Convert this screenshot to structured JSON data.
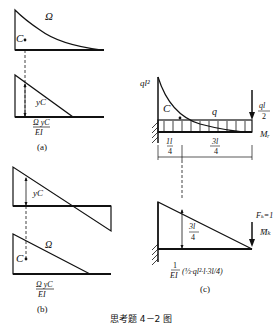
{
  "caption": "思考题 4－2 图",
  "panel_a": {
    "label": "(a)",
    "area_label": "Ω",
    "centroid_label": "C",
    "ordinate_label": "yC",
    "result_num": "Ω yC",
    "result_den": "EI"
  },
  "panel_b": {
    "label": "(b)",
    "area_label": "Ω",
    "centroid_label": "C",
    "ordinate_label": "yC",
    "result_num": "Ω yC",
    "result_den": "EI"
  },
  "panel_c": {
    "label": "(c)",
    "moment_top": "ql²",
    "centroid_label": "C",
    "load_label": "q",
    "force_num": "ql",
    "force_den": "2",
    "fixed_end_moment": "Mᵣ",
    "dim_left_num": "1l",
    "dim_left_den": "4",
    "dim_right_num": "3l",
    "dim_right_den": "4",
    "ordinate_num": "3l",
    "ordinate_den": "4",
    "unit_force": "Fₖ=1",
    "unit_moment": "M̄ₖ",
    "result_prefix_num": "1",
    "result_prefix_den": "EI",
    "result_body": "(⅓·ql²·l·3l/4)"
  }
}
